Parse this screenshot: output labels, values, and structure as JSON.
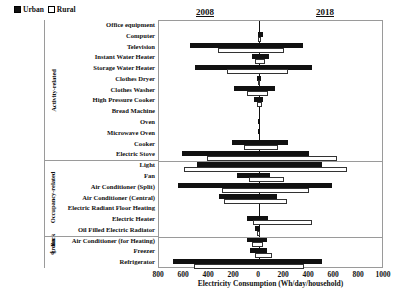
{
  "legend": {
    "items": [
      {
        "label": "Urban",
        "style": "filled",
        "color": "#111111"
      },
      {
        "label": "Rural",
        "style": "hollow",
        "color": "#ffffff"
      }
    ]
  },
  "era_labels": {
    "left": "2008",
    "right": "2018"
  },
  "groups": [
    {
      "name": "Activity-related",
      "start": 0,
      "end": 12
    },
    {
      "name": "Occupancy-related",
      "start": 13,
      "end": 19
    },
    {
      "name": "Background",
      "start": 20,
      "end": 21
    }
  ],
  "chart_data": {
    "type": "bar",
    "orientation": "horizontal",
    "title": "",
    "xlabel": "Electricity Consumption (Wh/day/household)",
    "ylabel": "",
    "xlim": [
      -800,
      1000
    ],
    "xticks": [
      -800,
      -600,
      -400,
      -200,
      0,
      200,
      400,
      600,
      800,
      1000
    ],
    "xticklabels": [
      "800",
      "600",
      "400",
      "200",
      "0",
      "200",
      "400",
      "600",
      "800",
      "1000"
    ],
    "grid": false,
    "legend_position": "top-left",
    "annotations": [
      "2008",
      "2018"
    ],
    "note": "Negative x = 2008 values, positive x = 2018 values. Each appliance row has an Urban (filled) bar and a Rural (hollow) bar spanning from its 2008 value to its 2018 value.",
    "categories": [
      "Office equipment",
      "Computer",
      "Television",
      "Instant Water Heater",
      "Storage Water Heater",
      "Clothes Dryer",
      "Clothes Washer",
      "High Pressure Cooker",
      "Bread Machine",
      "Oven",
      "Microwave Oven",
      "Cooker",
      "Electric Stove",
      "Light",
      "Fan",
      "Air Conditioner (Split)",
      "Air Conditioner (Central)",
      "Electric Radiant Floor Heating",
      "Electric Heater",
      "Oil Filled Electric Radiator",
      "Air Conditioner (for Heating)",
      "Freezer",
      "Refrigerator"
    ],
    "series": [
      {
        "name": "Urban",
        "style": "filled",
        "values_2008": [
          0,
          -10,
          -550,
          -60,
          -510,
          -20,
          -200,
          -40,
          0,
          -5,
          -5,
          -220,
          -620,
          -500,
          -180,
          -650,
          -320,
          0,
          -100,
          -30,
          -100,
          -70,
          -690
        ],
        "values_2018": [
          0,
          30,
          350,
          80,
          420,
          15,
          130,
          35,
          0,
          5,
          5,
          230,
          400,
          500,
          90,
          580,
          140,
          0,
          70,
          10,
          60,
          60,
          500
        ]
      },
      {
        "name": "Rural",
        "style": "hollow",
        "values_2008": [
          0,
          -5,
          -330,
          -35,
          -260,
          -10,
          -100,
          -20,
          0,
          0,
          0,
          -120,
          -420,
          -600,
          -80,
          -300,
          -280,
          0,
          -50,
          -15,
          -60,
          -30,
          -520
        ],
        "values_2018": [
          0,
          15,
          200,
          50,
          230,
          10,
          70,
          20,
          0,
          0,
          0,
          150,
          620,
          700,
          200,
          400,
          220,
          0,
          420,
          5,
          30,
          100,
          360
        ]
      }
    ]
  }
}
